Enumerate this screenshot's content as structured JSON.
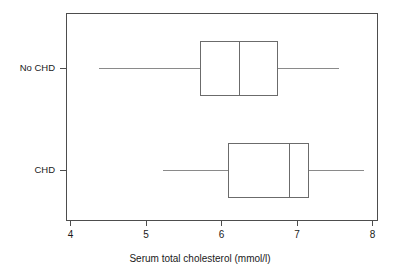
{
  "chart_data": {
    "type": "box",
    "title": "",
    "xlabel": "Serum total cholesterol (mmol/l)",
    "ylabel": "",
    "orientation": "horizontal",
    "xlim": [
      4,
      8
    ],
    "xticks": [
      4,
      5,
      6,
      7,
      8
    ],
    "xticklabels": [
      "4",
      "5",
      "6",
      "7",
      "8"
    ],
    "grid": false,
    "legend": null,
    "categories": [
      "No CHD",
      "CHD"
    ],
    "boxes": [
      {
        "label": "No CHD",
        "whisker_low": 4.37,
        "q1": 5.71,
        "median": 6.23,
        "q3": 6.74,
        "whisker_high": 7.54,
        "outliers": []
      },
      {
        "label": "CHD",
        "whisker_low": 5.21,
        "q1": 6.09,
        "median": 6.89,
        "q3": 7.15,
        "whisker_high": 7.88,
        "outliers": []
      }
    ]
  },
  "axis": {
    "tick_0": "4",
    "tick_1": "5",
    "tick_2": "6",
    "tick_3": "7",
    "tick_4": "8",
    "title": "Serum total cholesterol (mmol/l)"
  },
  "categories": {
    "no_chd": "No CHD",
    "chd": "CHD"
  },
  "colors": {
    "frame": "#4d4d4d",
    "box": "#6b6b6b",
    "whisker": "#8a8a8a",
    "background": "#ffffff",
    "text": "#1a1a1a"
  }
}
